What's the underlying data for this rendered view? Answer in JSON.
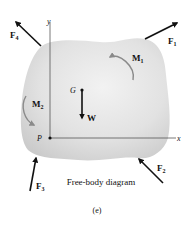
{
  "diagram": {
    "caption": "Free-body diagram",
    "figure_label": "(e)",
    "axes": {
      "x_label": "x",
      "y_label": "y",
      "origin_label": "P"
    },
    "center_of_gravity_label": "G",
    "weight_label": "W",
    "forces": [
      {
        "name": "F",
        "sub": "1"
      },
      {
        "name": "F",
        "sub": "2"
      },
      {
        "name": "F",
        "sub": "3"
      },
      {
        "name": "F",
        "sub": "4"
      }
    ],
    "moments": [
      {
        "name": "M",
        "sub": "1"
      },
      {
        "name": "M",
        "sub": "2"
      }
    ],
    "colors": {
      "body_fill": "#e4e4e4",
      "body_shade": "#cfcfcf",
      "arrow": "#111111",
      "moment_arrow": "#8a8a8a",
      "axis": "#555555"
    }
  }
}
